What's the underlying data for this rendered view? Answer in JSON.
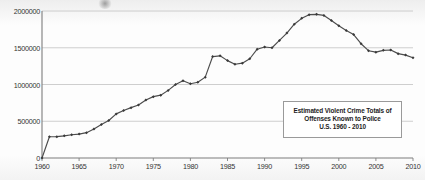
{
  "chart_data": {
    "type": "line",
    "title": "",
    "xlabel": "",
    "ylabel": "",
    "xlim": [
      1960,
      2010
    ],
    "ylim": [
      0,
      2000000
    ],
    "grid": true,
    "legend": false,
    "annotation_lines": [
      "Estimated Violent Crime Totals of",
      "Offenses Known to Police",
      "U.S.  1960 - 2010"
    ],
    "y_ticks": [
      0,
      500000,
      1000000,
      1500000,
      2000000
    ],
    "y_tick_labels": [
      "0",
      "500000",
      "1000000",
      "1500000",
      "2000000"
    ],
    "x_ticks": [
      1960,
      1965,
      1970,
      1975,
      1980,
      1985,
      1990,
      1995,
      2000,
      2005,
      2010
    ],
    "x_tick_labels": [
      "1960",
      "1965",
      "1970",
      "1975",
      "1980",
      "1985",
      "1990",
      "1995",
      "2000",
      "2005",
      "2010"
    ],
    "marker": "diamond",
    "line_color": "#4c4c4c",
    "marker_color": "#3a3a3a",
    "grid_color": "#c8c8c8",
    "axis_color": "#808080",
    "series": [
      {
        "name": "Estimated Violent Crime Totals",
        "x": [
          1960,
          1961,
          1962,
          1963,
          1964,
          1965,
          1966,
          1967,
          1968,
          1969,
          1970,
          1971,
          1972,
          1973,
          1974,
          1975,
          1976,
          1977,
          1978,
          1979,
          1980,
          1981,
          1982,
          1983,
          1984,
          1985,
          1986,
          1987,
          1988,
          1989,
          1990,
          1991,
          1992,
          1993,
          1994,
          1995,
          1996,
          1997,
          1998,
          1999,
          2000,
          2001,
          2002,
          2003,
          2004,
          2005,
          2006,
          2007,
          2008,
          2009,
          2010
        ],
        "values": [
          0,
          288460,
          290000,
          301510,
          316970,
          325000,
          345000,
          396000,
          455000,
          510000,
          600000,
          645000,
          685000,
          720000,
          790000,
          835000,
          855000,
          920000,
          1000000,
          1050000,
          1010000,
          1030000,
          1100000,
          1380000,
          1390000,
          1325000,
          1275000,
          1290000,
          1350000,
          1480000,
          1510000,
          1500000,
          1600000,
          1700000,
          1820000,
          1900000,
          1950000,
          1955000,
          1940000,
          1870000,
          1800000,
          1735000,
          1680000,
          1555000,
          1460000,
          1440000,
          1465000,
          1470000,
          1420000,
          1400000,
          1365000
        ]
      }
    ]
  },
  "axes": {
    "y_axis_name": "violent-crime-total",
    "x_axis_name": "year"
  }
}
